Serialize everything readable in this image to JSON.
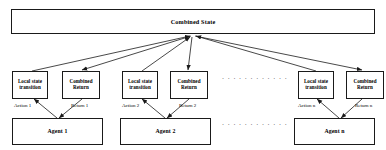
{
  "diagram": {
    "title_node": {
      "label": "Combined State",
      "name": "combined-state-node"
    },
    "groups": [
      {
        "id": 1,
        "local_state_label": "Local state transition",
        "combined_return_label": "Combined Return",
        "action_label": "Action 1",
        "return_label": "Return 1",
        "agent_label": "Agent 1"
      },
      {
        "id": 2,
        "local_state_label": "Local state transition",
        "combined_return_label": "Combined Return",
        "action_label": "Action 2",
        "return_label": "Return 2",
        "agent_label": "Agent 2"
      },
      {
        "id": "n",
        "local_state_label": "Local state transition",
        "combined_return_label": "Combined Return",
        "action_label": "Action n",
        "return_label": "Return n",
        "agent_label": "Agent n"
      }
    ],
    "ellipsis": {
      "upper": "· · · · · · · · · · · ·",
      "lower": "· · · · · · · · · · · ·"
    },
    "colors": {
      "stroke": "#1a1a1a",
      "fill": "#ffffff",
      "text": "#000000"
    }
  }
}
